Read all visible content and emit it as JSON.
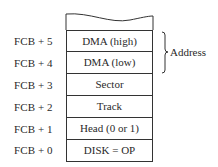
{
  "diagram": {
    "rows": [
      {
        "offset": "FCB + 5",
        "field": "DMA (high)"
      },
      {
        "offset": "FCB + 4",
        "field": "DMA (low)"
      },
      {
        "offset": "FCB + 3",
        "field": "Sector"
      },
      {
        "offset": "FCB + 2",
        "field": "Track"
      },
      {
        "offset": "FCB + 1",
        "field": "Head (0 or 1)"
      },
      {
        "offset": "FCB + 0",
        "field": "DISK = OP"
      }
    ],
    "brace_label": "Address"
  }
}
